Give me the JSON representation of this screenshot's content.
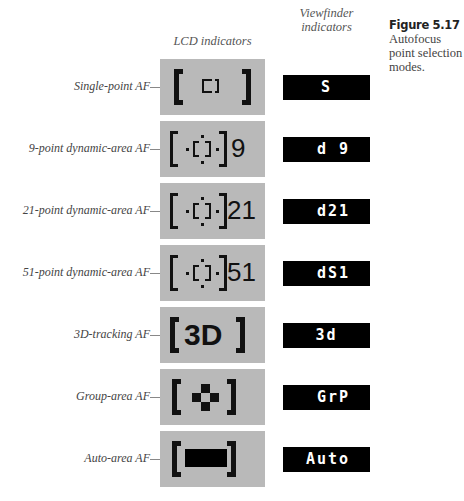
{
  "headers": {
    "lcd": "LCD indicators",
    "viewfinder_line1": "Viewfinder",
    "viewfinder_line2": "indicators"
  },
  "figure": {
    "title": "Figure 5.17",
    "caption": "Autofocus point selection modes."
  },
  "modes": [
    {
      "label": "Single-point AF",
      "lcd_icon": "single-point-bracket",
      "lcd_number": "",
      "viewfinder": "S"
    },
    {
      "label": "9-point dynamic-area AF",
      "lcd_icon": "dynamic-area-bracket",
      "lcd_number": "9",
      "viewfinder": "d 9"
    },
    {
      "label": "21-point dynamic-area AF",
      "lcd_icon": "dynamic-area-bracket",
      "lcd_number": "21",
      "viewfinder": "d21"
    },
    {
      "label": "51-point dynamic-area AF",
      "lcd_icon": "dynamic-area-bracket",
      "lcd_number": "51",
      "viewfinder": "dS1"
    },
    {
      "label": "3D-tracking AF",
      "lcd_icon": "3d-bracket",
      "lcd_number": "3D",
      "viewfinder": "3d"
    },
    {
      "label": "Group-area AF",
      "lcd_icon": "group-cross-bracket",
      "lcd_number": "",
      "viewfinder": "GrP"
    },
    {
      "label": "Auto-area AF",
      "lcd_icon": "auto-area-bar-bracket",
      "lcd_number": "",
      "viewfinder": "Auto"
    }
  ],
  "colors": {
    "lcd_background": "#b9b9b9",
    "viewfinder_background": "#000000",
    "viewfinder_text": "#ffffff"
  }
}
